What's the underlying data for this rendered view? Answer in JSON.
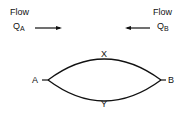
{
  "flow_a": {
    "label": "Flow",
    "symbol": "Q",
    "subscript": "A"
  },
  "flow_b": {
    "label": "Flow",
    "symbol": "Q",
    "subscript": "B"
  },
  "nodes": {
    "left": "A",
    "right": "B"
  },
  "paths": {
    "top": "X",
    "bottom": "Y"
  },
  "colors": {
    "stroke": "#111111",
    "background": "#ffffff"
  }
}
